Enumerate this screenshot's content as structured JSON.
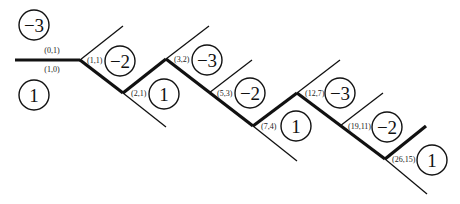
{
  "diagram": {
    "type": "continued-fraction zigzag path",
    "edge_labels": {
      "top": "(0,1)",
      "bottom": "(1,0)"
    },
    "nodes": [
      {
        "label": "(1,1)"
      },
      {
        "label": "(2,1)"
      },
      {
        "label": "(3,2)"
      },
      {
        "label": "(5,3)"
      },
      {
        "label": "(7,4)"
      },
      {
        "label": "(12,7)"
      },
      {
        "label": "(19,11)"
      },
      {
        "label": "(26,15)"
      }
    ],
    "regions": [
      {
        "value": "−3"
      },
      {
        "value": "1"
      },
      {
        "value": "−2"
      },
      {
        "value": "1"
      },
      {
        "value": "−3"
      },
      {
        "value": "−2"
      },
      {
        "value": "1"
      },
      {
        "value": "−3"
      },
      {
        "value": "−2"
      },
      {
        "value": "1"
      }
    ]
  }
}
